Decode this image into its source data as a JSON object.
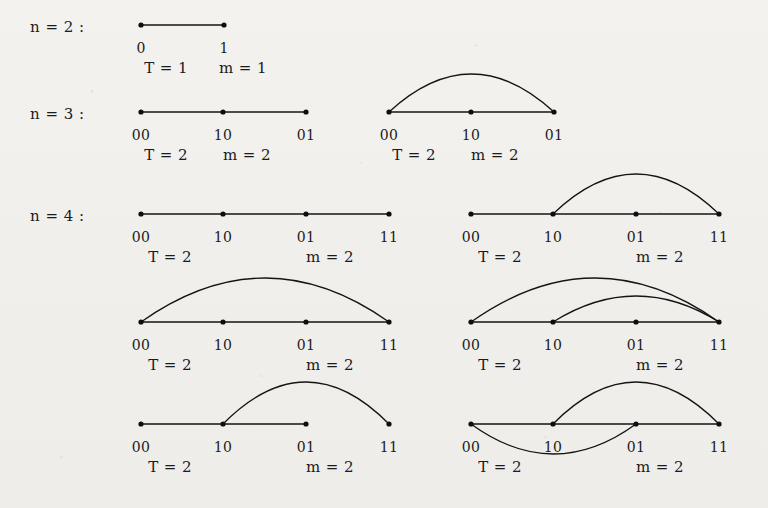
{
  "figure": {
    "background_color": "#f2f1ee",
    "ink_color": "#141414",
    "rows": [
      {
        "id": "n2",
        "label": "n = 2 :"
      },
      {
        "id": "n3",
        "label": "n = 3 :"
      },
      {
        "id": "n4",
        "label": "n = 4 :"
      }
    ]
  },
  "graphs": [
    {
      "id": "g1",
      "row": "n2",
      "column": "left",
      "baseline_y": 25,
      "node_labels": [
        "0",
        "1"
      ],
      "node_x": [
        141,
        224
      ],
      "path_edges": [
        [
          0,
          1
        ]
      ],
      "arcs": [],
      "stats": {
        "T": "T = 1",
        "m": "m = 1",
        "T_x": 166,
        "m_x": 243,
        "y": 61
      },
      "label_y": 41
    },
    {
      "id": "g2",
      "row": "n3",
      "column": "left",
      "baseline_y": 112,
      "node_labels": [
        "00",
        "10",
        "01"
      ],
      "node_x": [
        141,
        223,
        306
      ],
      "path_edges": [
        [
          0,
          1
        ],
        [
          1,
          2
        ]
      ],
      "arcs": [],
      "stats": {
        "T": "T = 2",
        "m": "m = 2",
        "T_x": 166,
        "m_x": 247,
        "y": 148
      },
      "label_y": 128
    },
    {
      "id": "g3",
      "row": "n3",
      "column": "right",
      "baseline_y": 112,
      "node_labels": [
        "00",
        "10",
        "01"
      ],
      "node_x": [
        389,
        471,
        554
      ],
      "path_edges": [
        [
          0,
          1
        ],
        [
          1,
          2
        ]
      ],
      "arcs": [
        {
          "from": 0,
          "to": 2,
          "height": 38,
          "side": "up"
        }
      ],
      "stats": {
        "T": "T = 2",
        "m": "m = 2",
        "T_x": 414,
        "m_x": 495,
        "y": 148
      },
      "label_y": 128
    },
    {
      "id": "g4",
      "row": "n4",
      "column": "left",
      "baseline_y": 214,
      "node_labels": [
        "00",
        "10",
        "01",
        "11"
      ],
      "node_x": [
        141,
        223,
        306,
        389
      ],
      "path_edges": [
        [
          0,
          1
        ],
        [
          1,
          2
        ],
        [
          2,
          3
        ]
      ],
      "arcs": [],
      "stats": {
        "T": "T = 2",
        "m": "m = 2",
        "T_x": 170,
        "m_x": 330,
        "y": 250
      },
      "label_y": 230
    },
    {
      "id": "g5",
      "row": "n4",
      "column": "right",
      "baseline_y": 214,
      "node_labels": [
        "00",
        "10",
        "01",
        "11"
      ],
      "node_x": [
        471,
        553,
        636,
        719
      ],
      "path_edges": [
        [
          0,
          1
        ],
        [
          1,
          2
        ],
        [
          2,
          3
        ]
      ],
      "arcs": [
        {
          "from": 1,
          "to": 3,
          "height": 40,
          "side": "up"
        }
      ],
      "stats": {
        "T": "T = 2",
        "m": "m = 2",
        "T_x": 500,
        "m_x": 660,
        "y": 250
      },
      "label_y": 230
    },
    {
      "id": "g6",
      "row": "n4",
      "column": "left",
      "baseline_y": 322,
      "node_labels": [
        "00",
        "10",
        "01",
        "11"
      ],
      "node_x": [
        141,
        223,
        306,
        389
      ],
      "path_edges": [
        [
          0,
          1
        ],
        [
          1,
          2
        ],
        [
          2,
          3
        ]
      ],
      "arcs": [
        {
          "from": 0,
          "to": 3,
          "height": 44,
          "side": "up"
        }
      ],
      "stats": {
        "T": "T = 2",
        "m": "m = 2",
        "T_x": 170,
        "m_x": 330,
        "y": 358
      },
      "label_y": 338
    },
    {
      "id": "g7",
      "row": "n4",
      "column": "right",
      "baseline_y": 322,
      "node_labels": [
        "00",
        "10",
        "01",
        "11"
      ],
      "node_x": [
        471,
        553,
        636,
        719
      ],
      "path_edges": [
        [
          0,
          1
        ],
        [
          1,
          2
        ],
        [
          2,
          3
        ]
      ],
      "arcs": [
        {
          "from": 0,
          "to": 3,
          "height": 44,
          "side": "up"
        },
        {
          "from": 1,
          "to": 3,
          "height": 26,
          "side": "up"
        }
      ],
      "stats": {
        "T": "T = 2",
        "m": "m = 2",
        "T_x": 500,
        "m_x": 660,
        "y": 358
      },
      "label_y": 338
    },
    {
      "id": "g8",
      "row": "n4",
      "column": "left",
      "baseline_y": 424,
      "node_labels": [
        "00",
        "10",
        "01",
        "11"
      ],
      "node_x": [
        141,
        223,
        306,
        389
      ],
      "path_edges": [
        [
          0,
          1
        ],
        [
          1,
          2
        ]
      ],
      "arcs": [
        {
          "from": 1,
          "to": 3,
          "height": 42,
          "side": "up"
        }
      ],
      "stats": {
        "T": "T = 2",
        "m": "m = 2",
        "T_x": 170,
        "m_x": 330,
        "y": 460
      },
      "label_y": 440
    },
    {
      "id": "g9",
      "row": "n4",
      "column": "right",
      "baseline_y": 424,
      "node_labels": [
        "00",
        "10",
        "01",
        "11"
      ],
      "node_x": [
        471,
        553,
        636,
        719
      ],
      "path_edges": [
        [
          0,
          1
        ],
        [
          1,
          2
        ],
        [
          2,
          3
        ]
      ],
      "arcs": [
        {
          "from": 1,
          "to": 3,
          "height": 42,
          "side": "up"
        },
        {
          "from": 0,
          "to": 2,
          "height": 30,
          "side": "down"
        }
      ],
      "stats": {
        "T": "T = 2",
        "m": "m = 2",
        "T_x": 500,
        "m_x": 660,
        "y": 460
      },
      "label_y": 440
    }
  ],
  "row_label_positions": [
    {
      "text_ref": 0,
      "x": 30,
      "y": 20
    },
    {
      "text_ref": 1,
      "x": 30,
      "y": 107
    },
    {
      "text_ref": 2,
      "x": 30,
      "y": 209
    }
  ]
}
